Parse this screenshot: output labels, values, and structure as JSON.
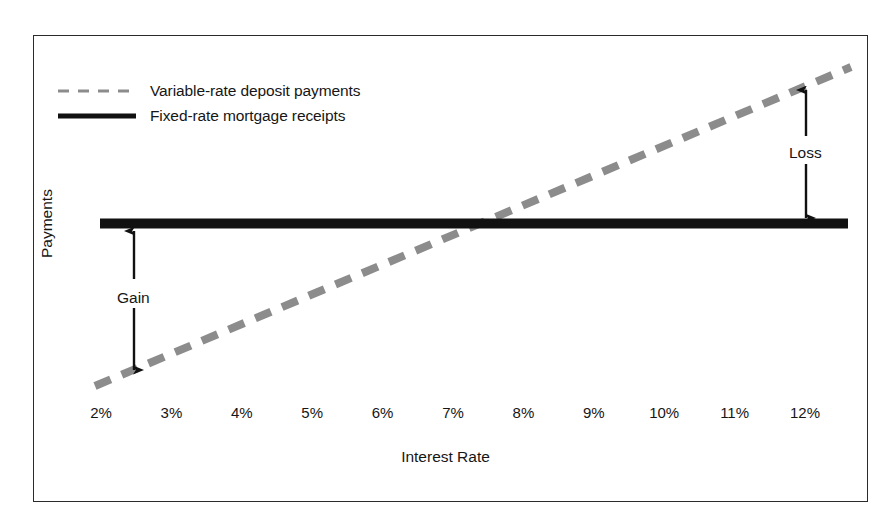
{
  "chart_data": {
    "type": "line",
    "title": "",
    "xlabel": "Interest Rate",
    "ylabel": "Payments",
    "categories": [
      "2%",
      "3%",
      "4%",
      "5%",
      "6%",
      "7%",
      "8%",
      "9%",
      "10%",
      "11%",
      "12%"
    ],
    "x": [
      2,
      3,
      4,
      5,
      6,
      7,
      8,
      9,
      10,
      11,
      12
    ],
    "xlim": [
      2,
      12
    ],
    "ylim": [
      0,
      100
    ],
    "grid": false,
    "legend_position": "top-left",
    "series": [
      {
        "name": "Variable-rate deposit payments",
        "style": "dashed",
        "color": "#8c8c8c",
        "values": [
          12,
          20.8,
          29.6,
          38.4,
          47.2,
          56,
          64.8,
          73.6,
          82.4,
          91.2,
          100
        ]
      },
      {
        "name": "Fixed-rate mortgage receipts",
        "style": "solid",
        "color": "#111111",
        "values": [
          60,
          60,
          60,
          60,
          60,
          60,
          60,
          60,
          60,
          60,
          60
        ]
      }
    ],
    "annotations": [
      {
        "label": "Gain",
        "kind": "double-headed-arrow",
        "x": 2.5,
        "from_series": "Variable-rate deposit payments",
        "to_series": "Fixed-rate mortgage receipts"
      },
      {
        "label": "Loss",
        "kind": "double-headed-arrow",
        "x": 11.45,
        "from_series": "Fixed-rate mortgage receipts",
        "to_series": "Variable-rate deposit payments"
      }
    ],
    "crossover_point": "7.4%"
  },
  "legend": {
    "items": [
      {
        "label": "Variable-rate deposit payments",
        "style": "dashed"
      },
      {
        "label": "Fixed-rate mortgage receipts",
        "style": "solid"
      }
    ]
  },
  "axes": {
    "x_title": "Interest Rate",
    "y_title": "Payments",
    "x_ticks": [
      "2%",
      "3%",
      "4%",
      "5%",
      "6%",
      "7%",
      "8%",
      "9%",
      "10%",
      "11%",
      "12%"
    ]
  },
  "annotations": {
    "gain": "Gain",
    "loss": "Loss"
  },
  "colors": {
    "frame": "#2b2b2b",
    "solid_line": "#111111",
    "dashed_line": "#8c8c8c",
    "text": "#161616",
    "background": "#ffffff"
  }
}
